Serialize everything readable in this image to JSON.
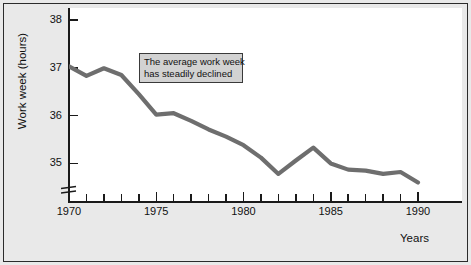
{
  "figure": {
    "background_color": "#e9e9e9",
    "plot_background_color": "#ffffff",
    "frame_color": "#2b2b2b",
    "line_color": "#6e6e6e"
  },
  "annotation": {
    "line1": "The average work week",
    "line2": "has steadily declined",
    "fill_color": "#d2d2d2",
    "border_color": "#3a3a3a"
  },
  "axis": {
    "y_title": "Work week (hours)",
    "x_title": "Years",
    "y_ticks": [
      "38",
      "37",
      "36",
      "35"
    ],
    "x_ticks": [
      "1970",
      "1975",
      "1980",
      "1985",
      "1990"
    ],
    "break_symbol": "axis-break"
  },
  "chart_data": {
    "type": "line",
    "title": "",
    "xlabel": "Years",
    "ylabel": "Work week (hours)",
    "xlim": [
      1970,
      1990
    ],
    "ylim": [
      34.2,
      38.1
    ],
    "grid": false,
    "legend": null,
    "annotations": [
      {
        "text": "The average work week has steadily declined",
        "x": 1974,
        "y": 37.5
      }
    ],
    "ytick_values": [
      38,
      37,
      36,
      35
    ],
    "xtick_values": [
      1970,
      1975,
      1980,
      1985,
      1990
    ],
    "xtick_minor_step": 1,
    "axis_break": {
      "axis": "y",
      "at": 34.55
    },
    "x": [
      1970,
      1971,
      1972,
      1973,
      1974,
      1975,
      1976,
      1977,
      1978,
      1979,
      1980,
      1981,
      1982,
      1983,
      1984,
      1985,
      1986,
      1987,
      1988,
      1989,
      1990
    ],
    "series": [
      {
        "name": "Average work week",
        "color": "#6e6e6e",
        "values": [
          37.03,
          36.83,
          36.99,
          36.85,
          36.45,
          36.02,
          36.05,
          35.89,
          35.71,
          35.56,
          35.38,
          35.12,
          34.78,
          35.06,
          35.33,
          35.0,
          34.87,
          34.85,
          34.78,
          34.82,
          34.6
        ]
      }
    ]
  }
}
